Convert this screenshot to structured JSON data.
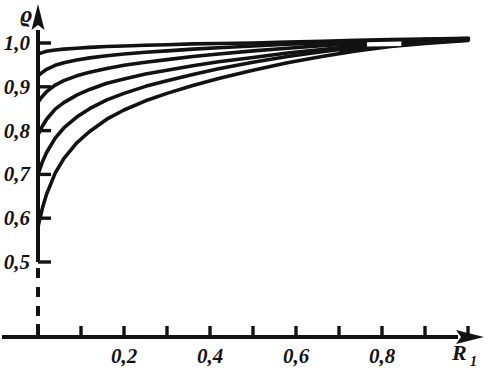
{
  "figure": {
    "background_color": "#ffffff",
    "ink_color": "#121212",
    "ylabel": "ϱ",
    "xlabel_base": "R",
    "xlabel_sub": "1"
  },
  "axes": {
    "y_ticks": [
      {
        "value": 0.5,
        "label": "0,5"
      },
      {
        "value": 0.6,
        "label": "0,6"
      },
      {
        "value": 0.7,
        "label": "0,7"
      },
      {
        "value": 0.8,
        "label": "0,8"
      },
      {
        "value": 0.9,
        "label": "0,9"
      },
      {
        "value": 1.0,
        "label": "1,0"
      }
    ],
    "x_ticks": [
      {
        "value": 0.1,
        "label": ""
      },
      {
        "value": 0.2,
        "label": "0,2"
      },
      {
        "value": 0.3,
        "label": ""
      },
      {
        "value": 0.4,
        "label": "0,4"
      },
      {
        "value": 0.5,
        "label": ""
      },
      {
        "value": 0.6,
        "label": "0,6"
      },
      {
        "value": 0.7,
        "label": ""
      },
      {
        "value": 0.8,
        "label": "0,8"
      },
      {
        "value": 0.9,
        "label": ""
      },
      {
        "value": 1.0,
        "label": ""
      }
    ],
    "y_break_dashed": true
  },
  "chart_data": {
    "type": "line",
    "title": "",
    "subtitle": "",
    "xlabel": "R₁",
    "ylabel": "ϱ",
    "xlim": [
      0.0,
      1.05
    ],
    "ylim": [
      0.5,
      1.03
    ],
    "grid": false,
    "legend": "none",
    "annotations": [
      "Curves converge into a dense black band near R1 = 0.72-0.85",
      "Dashed axis break below rho = 0.5"
    ],
    "series": [
      {
        "name": "curve-1",
        "x": [
          0.0,
          0.01,
          0.02,
          0.04,
          0.06,
          0.09,
          0.12,
          0.16,
          0.2,
          0.25,
          0.3,
          0.36,
          0.42,
          0.5,
          0.58,
          0.66,
          0.74,
          0.82,
          0.9,
          1.0
        ],
        "y": [
          0.975,
          0.978,
          0.981,
          0.984,
          0.986,
          0.988,
          0.99,
          0.992,
          0.993,
          0.995,
          0.996,
          0.998,
          0.999,
          1.0,
          1.002,
          1.004,
          1.006,
          1.008,
          1.009,
          1.011
        ]
      },
      {
        "name": "curve-2",
        "x": [
          0.0,
          0.01,
          0.02,
          0.04,
          0.06,
          0.09,
          0.12,
          0.16,
          0.2,
          0.25,
          0.3,
          0.36,
          0.42,
          0.5,
          0.58,
          0.66,
          0.74,
          0.82,
          0.9,
          1.0
        ],
        "y": [
          0.925,
          0.933,
          0.94,
          0.949,
          0.955,
          0.961,
          0.966,
          0.971,
          0.975,
          0.979,
          0.982,
          0.986,
          0.989,
          0.993,
          0.997,
          1.0,
          1.003,
          1.006,
          1.008,
          1.01
        ]
      },
      {
        "name": "curve-3",
        "x": [
          0.0,
          0.01,
          0.02,
          0.04,
          0.06,
          0.09,
          0.12,
          0.16,
          0.2,
          0.25,
          0.3,
          0.36,
          0.42,
          0.5,
          0.58,
          0.66,
          0.74,
          0.82,
          0.9,
          1.0
        ],
        "y": [
          0.865,
          0.878,
          0.889,
          0.904,
          0.914,
          0.925,
          0.933,
          0.942,
          0.949,
          0.956,
          0.962,
          0.969,
          0.975,
          0.982,
          0.988,
          0.994,
          0.999,
          1.003,
          1.006,
          1.009
        ]
      },
      {
        "name": "curve-4",
        "x": [
          0.0,
          0.01,
          0.02,
          0.04,
          0.06,
          0.09,
          0.12,
          0.16,
          0.2,
          0.25,
          0.3,
          0.36,
          0.42,
          0.5,
          0.58,
          0.66,
          0.74,
          0.82,
          0.9,
          1.0
        ],
        "y": [
          0.79,
          0.81,
          0.826,
          0.849,
          0.864,
          0.881,
          0.894,
          0.908,
          0.918,
          0.929,
          0.938,
          0.948,
          0.957,
          0.967,
          0.977,
          0.985,
          0.993,
          0.999,
          1.003,
          1.008
        ]
      },
      {
        "name": "curve-5",
        "x": [
          0.0,
          0.01,
          0.02,
          0.04,
          0.06,
          0.09,
          0.12,
          0.16,
          0.2,
          0.25,
          0.3,
          0.36,
          0.42,
          0.5,
          0.58,
          0.66,
          0.74,
          0.82,
          0.9,
          1.0
        ],
        "y": [
          0.7,
          0.728,
          0.75,
          0.783,
          0.806,
          0.831,
          0.85,
          0.87,
          0.885,
          0.901,
          0.914,
          0.928,
          0.941,
          0.956,
          0.969,
          0.98,
          0.99,
          0.997,
          1.002,
          1.007
        ]
      },
      {
        "name": "curve-6",
        "x": [
          0.0,
          0.01,
          0.02,
          0.04,
          0.06,
          0.09,
          0.12,
          0.16,
          0.2,
          0.25,
          0.3,
          0.36,
          0.42,
          0.5,
          0.58,
          0.66,
          0.74,
          0.82,
          0.9,
          1.0
        ],
        "y": [
          0.58,
          0.622,
          0.655,
          0.703,
          0.736,
          0.772,
          0.798,
          0.826,
          0.847,
          0.868,
          0.885,
          0.903,
          0.919,
          0.938,
          0.955,
          0.969,
          0.982,
          0.992,
          0.999,
          1.006
        ]
      }
    ]
  }
}
